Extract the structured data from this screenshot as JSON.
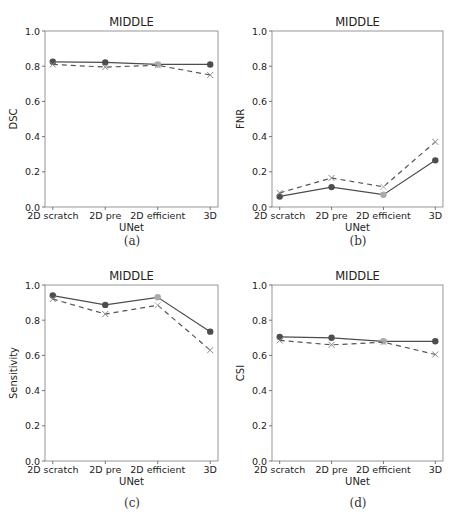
{
  "figure": {
    "captions": [
      "(a)",
      "(b)",
      "(c)",
      "(d)"
    ],
    "colors": {
      "series_solid": "#4d4d4d",
      "series_dashed": "#555555",
      "highlight_marker": "#aaaaaa",
      "axis": "#8c8c8c"
    }
  },
  "chart_data": [
    {
      "type": "line",
      "panel": "(a)",
      "title": "MIDDLE",
      "xlabel": "UNet",
      "ylabel": "DSC",
      "categories": [
        "2D scratch",
        "2D pre",
        "2D efficient",
        "3D"
      ],
      "ylim": [
        0.0,
        1.0
      ],
      "yticks": [
        "0.0",
        "0.2",
        "0.4",
        "0.6",
        "0.8",
        "1.0"
      ],
      "grid": false,
      "legend": null,
      "series": [
        {
          "name": "solid (circle markers)",
          "style": "solid",
          "marker": "o",
          "values": [
            0.825,
            0.822,
            0.81,
            0.81
          ]
        },
        {
          "name": "dashed (x markers)",
          "style": "dashed",
          "marker": "x",
          "values": [
            0.81,
            0.795,
            0.805,
            0.75
          ]
        }
      ]
    },
    {
      "type": "line",
      "panel": "(b)",
      "title": "MIDDLE",
      "xlabel": "UNet",
      "ylabel": "FNR",
      "categories": [
        "2D scratch",
        "2D pre",
        "2D efficient",
        "3D"
      ],
      "ylim": [
        0.0,
        1.0
      ],
      "yticks": [
        "0.0",
        "0.2",
        "0.4",
        "0.6",
        "0.8",
        "1.0"
      ],
      "grid": false,
      "legend": null,
      "series": [
        {
          "name": "solid (circle markers)",
          "style": "solid",
          "marker": "o",
          "values": [
            0.06,
            0.113,
            0.07,
            0.265
          ]
        },
        {
          "name": "dashed (x markers)",
          "style": "dashed",
          "marker": "x",
          "values": [
            0.08,
            0.165,
            0.115,
            0.37
          ]
        }
      ]
    },
    {
      "type": "line",
      "panel": "(c)",
      "title": "MIDDLE",
      "xlabel": "UNet",
      "ylabel": "Sensitivity",
      "categories": [
        "2D scratch",
        "2D pre",
        "2D efficient",
        "3D"
      ],
      "ylim": [
        0.0,
        1.0
      ],
      "yticks": [
        "0.0",
        "0.2",
        "0.4",
        "0.6",
        "0.8",
        "1.0"
      ],
      "grid": false,
      "legend": null,
      "series": [
        {
          "name": "solid (circle markers)",
          "style": "solid",
          "marker": "o",
          "values": [
            0.94,
            0.887,
            0.93,
            0.735
          ]
        },
        {
          "name": "dashed (x markers)",
          "style": "dashed",
          "marker": "x",
          "values": [
            0.92,
            0.835,
            0.885,
            0.63
          ]
        }
      ]
    },
    {
      "type": "line",
      "panel": "(d)",
      "title": "MIDDLE",
      "xlabel": "UNet",
      "ylabel": "CSI",
      "categories": [
        "2D scratch",
        "2D pre",
        "2D efficient",
        "3D"
      ],
      "ylim": [
        0.0,
        1.0
      ],
      "yticks": [
        "0.0",
        "0.2",
        "0.4",
        "0.6",
        "0.8",
        "1.0"
      ],
      "grid": false,
      "legend": null,
      "series": [
        {
          "name": "solid (circle markers)",
          "style": "solid",
          "marker": "o",
          "values": [
            0.705,
            0.7,
            0.68,
            0.68
          ]
        },
        {
          "name": "dashed (x markers)",
          "style": "dashed",
          "marker": "x",
          "values": [
            0.685,
            0.66,
            0.675,
            0.605
          ]
        }
      ]
    }
  ]
}
